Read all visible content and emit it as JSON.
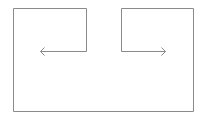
{
  "diagram": {
    "stroke_color": "#8a8a8a",
    "background_color": "#ffffff",
    "arrows": [
      {
        "name": "left-arrow",
        "direction": "left"
      },
      {
        "name": "right-arrow",
        "direction": "right"
      }
    ]
  }
}
